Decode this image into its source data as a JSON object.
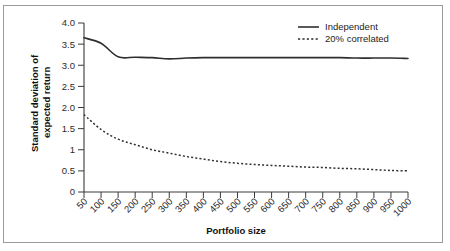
{
  "chart_data": {
    "type": "line",
    "title": "",
    "xlabel": "Portfolio size",
    "ylabel": "Standard deviation of expected return",
    "ylabel_lines": [
      "Standard deviation of",
      "expected return"
    ],
    "x": [
      50,
      100,
      150,
      200,
      250,
      300,
      350,
      400,
      450,
      500,
      550,
      600,
      650,
      700,
      750,
      800,
      850,
      900,
      950,
      1000
    ],
    "xlim": [
      50,
      1000
    ],
    "ylim": [
      0,
      4.0
    ],
    "xticks": [
      50,
      100,
      150,
      200,
      250,
      300,
      350,
      400,
      450,
      500,
      550,
      600,
      650,
      700,
      750,
      800,
      850,
      900,
      950,
      1000
    ],
    "xtick_labels": [
      "50",
      "100",
      "150",
      "200",
      "250",
      "300",
      "350",
      "400",
      "450",
      "500",
      "550",
      "600",
      "650",
      "700",
      "750",
      "800",
      "850",
      "900",
      "950",
      "1000"
    ],
    "yticks": [
      0,
      0.5,
      1,
      1.5,
      2.0,
      2.5,
      3.0,
      3.5,
      4.0
    ],
    "ytick_labels": [
      "0",
      "0.5",
      "1",
      "1.5",
      "2.0",
      "2.5",
      "3.0",
      "3.5",
      "4.0"
    ],
    "grid": false,
    "legend_position": "top-right",
    "series": [
      {
        "name": "Independent",
        "style": "solid",
        "color": "#2f2f2f",
        "values": [
          3.65,
          3.52,
          3.2,
          3.19,
          3.18,
          3.15,
          3.17,
          3.18,
          3.18,
          3.18,
          3.18,
          3.18,
          3.18,
          3.18,
          3.18,
          3.18,
          3.17,
          3.17,
          3.17,
          3.16
        ]
      },
      {
        "name": "20% correlated",
        "style": "dashed",
        "color": "#2f2f2f",
        "values": [
          1.83,
          1.48,
          1.25,
          1.12,
          1.0,
          0.92,
          0.84,
          0.78,
          0.72,
          0.68,
          0.65,
          0.63,
          0.61,
          0.59,
          0.58,
          0.56,
          0.55,
          0.53,
          0.51,
          0.5
        ]
      }
    ]
  },
  "legend": {
    "items": [
      {
        "label": "Independent",
        "style": "solid"
      },
      {
        "label": "20% correlated",
        "style": "dashed"
      }
    ]
  },
  "figure": {
    "border_color": "#9b9b9b",
    "background": "#ffffff",
    "ink_color": "#2f2f2f"
  }
}
